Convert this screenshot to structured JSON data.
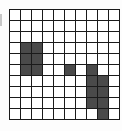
{
  "puzzle": {
    "rows": 10,
    "cols": 10,
    "colors": {
      "empty": "#ffffff",
      "filled": "#4a4a4a",
      "grid_line": "#1a1a1a"
    },
    "filled_cells": [
      [
        3,
        1
      ],
      [
        3,
        2
      ],
      [
        4,
        1
      ],
      [
        4,
        2
      ],
      [
        5,
        1
      ],
      [
        5,
        2
      ],
      [
        5,
        5
      ],
      [
        5,
        7
      ],
      [
        6,
        7
      ],
      [
        6,
        8
      ],
      [
        7,
        7
      ],
      [
        7,
        8
      ],
      [
        8,
        7
      ],
      [
        8,
        8
      ],
      [
        9,
        8
      ]
    ]
  }
}
